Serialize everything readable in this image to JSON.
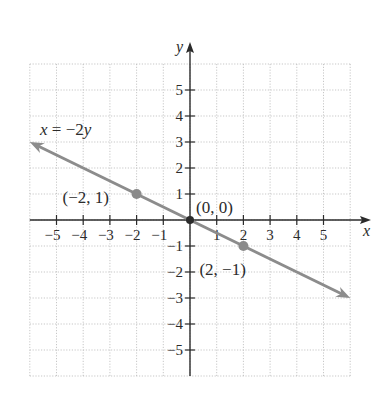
{
  "chart_data": {
    "type": "line",
    "title": "",
    "xlabel": "x",
    "ylabel": "y",
    "xlim": [
      -6,
      6
    ],
    "ylim": [
      -6,
      6
    ],
    "grid": true,
    "x_ticks": [
      -5,
      -4,
      -3,
      -2,
      -1,
      1,
      2,
      3,
      4,
      5
    ],
    "y_ticks": [
      -5,
      -4,
      -3,
      -2,
      -1,
      1,
      2,
      3,
      4,
      5
    ],
    "x_tick_labels": [
      "−5",
      "−4",
      "−3",
      "−2",
      "−1",
      "1",
      "2",
      "3",
      "4",
      "5"
    ],
    "y_tick_labels": [
      "−5",
      "−4",
      "−3",
      "−2",
      "−1",
      "1",
      "2",
      "3",
      "4",
      "5"
    ],
    "series": [
      {
        "name": "x = −2y",
        "equation": "x = -2y",
        "slope": -0.5,
        "intercept": 0,
        "x": [
          -6,
          6
        ],
        "y": [
          3,
          -3
        ],
        "color": "#8c8c8c",
        "arrows_both_ends": true
      }
    ],
    "points": [
      {
        "x": -2,
        "y": 1,
        "label": "(−2, 1)"
      },
      {
        "x": 0,
        "y": 0,
        "label": "(0, 0)"
      },
      {
        "x": 2,
        "y": -1,
        "label": "(2, −1)"
      }
    ],
    "annotations": [
      {
        "text": "x = −2y",
        "near": [
          -5.5,
          3.2
        ]
      }
    ]
  },
  "labels": {
    "equation_x": "x",
    "equation_mid": " = −2",
    "equation_y": "y",
    "x_axis": "x",
    "y_axis": "y"
  },
  "colors": {
    "line": "#8c8c8c",
    "axis": "#2b2b2b",
    "grid": "#b9b9b9"
  }
}
